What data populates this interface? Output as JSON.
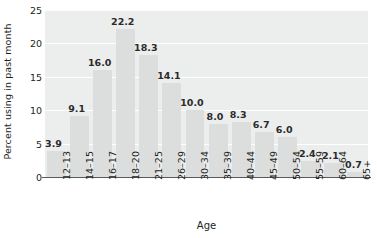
{
  "chart_data": {
    "type": "bar",
    "title": "",
    "xlabel": "Age",
    "ylabel": "Percent using in past month",
    "categories": [
      "12–13",
      "14–15",
      "16–17",
      "18–20",
      "21–25",
      "26–29",
      "30–34",
      "35–39",
      "40–44",
      "45–49",
      "50–54",
      "55–59",
      "60–64",
      "65+"
    ],
    "values": [
      3.9,
      9.1,
      16.0,
      22.2,
      18.3,
      14.1,
      10.0,
      8.0,
      8.3,
      6.7,
      6.0,
      2.4,
      2.1,
      0.7
    ],
    "value_labels": [
      "3.9",
      "9.1",
      "16.0",
      "22.2",
      "18.3",
      "14.1",
      "10.0",
      "8.0",
      "8.3",
      "6.7",
      "6.0",
      "2.4",
      "2.1",
      "0.7"
    ],
    "ylim": [
      0,
      25
    ],
    "yticks": [
      0,
      5,
      10,
      15,
      20,
      25
    ],
    "ytick_labels": [
      "0",
      "5",
      "10",
      "15",
      "20",
      "25"
    ],
    "grid": true,
    "grid_axis": "y",
    "legend": null,
    "colors": {
      "bar": "#dcdddd",
      "plot_background": "#eceded",
      "gridline": "#ffffff",
      "axis": "#58595b",
      "text": "#231f20",
      "value_label": "#2b2b2b",
      "figure_background": "#ffffff"
    }
  }
}
